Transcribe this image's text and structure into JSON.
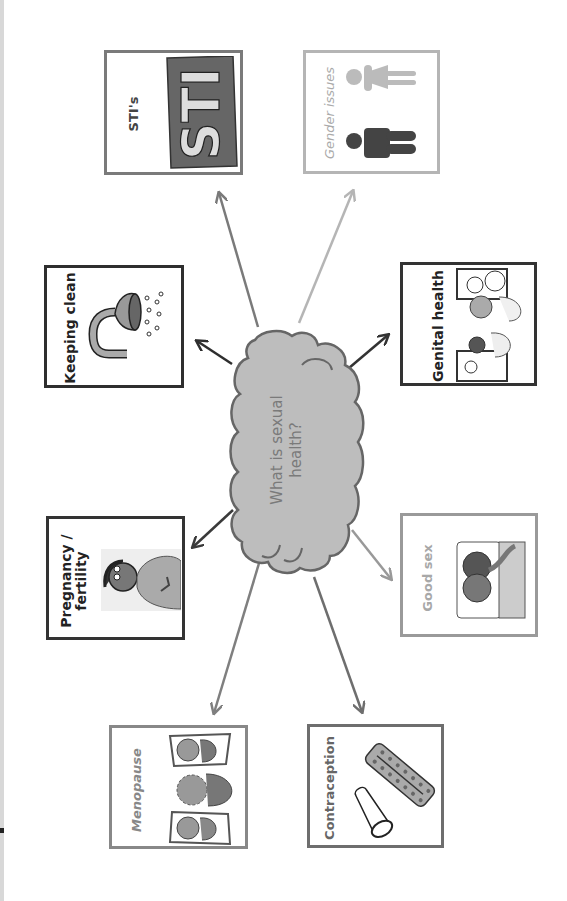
{
  "center": {
    "line1": "What is sexual",
    "line2": "health?"
  },
  "topics": [
    {
      "id": "sti",
      "label": "STI's",
      "border": "#7a7a7a",
      "text_color": "#444444",
      "arrow_color": "#7a7a7a",
      "image_text": "STI"
    },
    {
      "id": "gender",
      "label": "Gender issues",
      "border": "#b5b5b5",
      "text_color": "#aaaaaa",
      "arrow_color": "#b5b5b5"
    },
    {
      "id": "keeping-clean",
      "label": "Keeping clean",
      "border": "#2e2e2e",
      "text_color": "#222222",
      "arrow_color": "#2e2e2e"
    },
    {
      "id": "genital-health",
      "label": "Genital health",
      "border": "#333333",
      "text_color": "#222222",
      "arrow_color": "#333333"
    },
    {
      "id": "pregnancy",
      "label": "Pregnancy / fertility",
      "border": "#333333",
      "text_color": "#222222",
      "arrow_color": "#3a3a3a"
    },
    {
      "id": "good-sex",
      "label": "Good sex",
      "border": "#9a9a9a",
      "text_color": "#a8a8a8",
      "arrow_color": "#999999"
    },
    {
      "id": "menopause",
      "label": "Menopause",
      "border": "#888888",
      "text_color": "#888888",
      "arrow_color": "#7f7f7f"
    },
    {
      "id": "contraception",
      "label": "Contraception",
      "border": "#6e6e6e",
      "text_color": "#666666",
      "arrow_color": "#6e6e6e"
    }
  ],
  "colors": {
    "cloud_fill": "#bdbdbd",
    "cloud_stroke": "#666666"
  }
}
